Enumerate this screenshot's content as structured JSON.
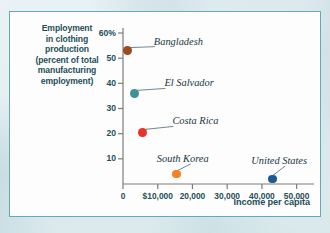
{
  "chart_data": {
    "type": "scatter",
    "title": "",
    "xlabel": "Income per capita",
    "ylabel": "Employment in clothing production (percent of total manufacturing employment)",
    "ylabel_lines": [
      "Employment",
      "in clothing",
      "production",
      "(percent of total",
      "manufacturing",
      "employment)"
    ],
    "xlim": [
      0,
      55000
    ],
    "ylim": [
      0,
      62
    ],
    "grid": false,
    "legend": "none (points labeled directly)",
    "xticks": [
      0,
      10000,
      20000,
      30000,
      40000,
      50000
    ],
    "xtick_labels": [
      "0",
      "$10,000",
      "20,000",
      "30,000",
      "40,000",
      "50,000"
    ],
    "yticks": [
      10,
      20,
      30,
      40,
      50,
      60
    ],
    "ytick_labels": [
      "10",
      "20",
      "30",
      "40",
      "50",
      "60%"
    ],
    "points": [
      {
        "name": "Bangladesh",
        "x": 1400,
        "y": 53,
        "color": "#9c4a20",
        "label_dx": 26,
        "label_dy": -15
      },
      {
        "name": "El Salvador",
        "x": 3300,
        "y": 36,
        "color": "#3f9099",
        "label_dx": 30,
        "label_dy": -16
      },
      {
        "name": "Costa Rica",
        "x": 5600,
        "y": 20.5,
        "color": "#e8332a",
        "label_dx": 30,
        "label_dy": -17
      },
      {
        "name": "South Korea",
        "x": 15500,
        "y": 4,
        "color": "#f58220",
        "label_dx": -20,
        "label_dy": -21
      },
      {
        "name": "United States",
        "x": 43000,
        "y": 2,
        "color": "#1c5b8f",
        "label_dx": -21,
        "label_dy": -24
      }
    ]
  },
  "colors": {
    "panel_background": "#fdfdfd",
    "panel_border": "#63aab7",
    "page_background": "#c8dde2",
    "axis_text": "#1d4f58",
    "axis_line": "#7d7d7d",
    "label_text": "#18353d"
  }
}
